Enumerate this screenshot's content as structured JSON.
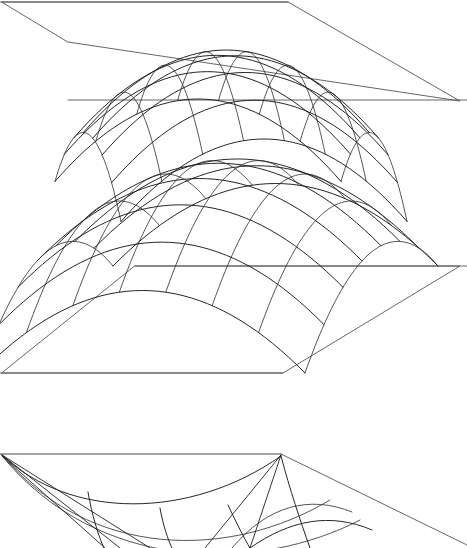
{
  "figure": {
    "background_color": "#ffffff",
    "line_color": "#1a1a1a",
    "plane_color": "#555555",
    "width": 467,
    "height": 548,
    "panel_count": 3
  },
  "panels": [
    {
      "id": "panel-top",
      "name": "elliptic-paraboloid-bowl",
      "caption": "",
      "surface_type": "elliptic paraboloid opening upward",
      "orientation": "bowl",
      "plane": {
        "shape": "parallelogram",
        "back_left": [
          2,
          2
        ],
        "back_right": [
          288,
          2
        ],
        "front_right": [
          460,
          101
        ],
        "front_left": [
          68,
          42
        ],
        "note": "oblique projection of a horizontal cutting plane"
      },
      "curves": {
        "family_a_count": 8,
        "family_b_count": 8,
        "family_a_name": "parabolas along u",
        "family_b_name": "parabolas along v",
        "vertex_depth_px": 170,
        "low_point": [
          205,
          172
        ]
      }
    },
    {
      "id": "panel-middle",
      "name": "elliptic-paraboloid-dome",
      "caption": "",
      "surface_type": "elliptic paraboloid opening downward",
      "orientation": "dome",
      "plane": {
        "shape": "parallelogram",
        "back_left": [
          135,
          266
        ],
        "back_right": [
          460,
          266
        ],
        "front_right": [
          283,
          373
        ],
        "front_left": [
          2,
          373
        ],
        "note": "oblique projection of a horizontal cutting plane"
      },
      "curves": {
        "family_a_count": 8,
        "family_b_count": 8,
        "family_a_name": "parabolas along u",
        "family_b_name": "parabolas along v",
        "apex": [
          237,
          196
        ]
      }
    },
    {
      "id": "panel-bottom",
      "name": "hyperbolic-paraboloid-partial",
      "caption": "",
      "surface_type": "saddle / paraboloid, cropped by image edge",
      "orientation": "cropped",
      "plane": {
        "shape": "parallelogram-partial",
        "back_left": [
          2,
          454
        ],
        "back_right": [
          281,
          454
        ],
        "front_right": [
          460,
          548
        ],
        "front_left": [
          2,
          548
        ],
        "note": "lower figure is cut off by the bottom of the frame"
      },
      "curves": {
        "family_a_count": 5,
        "family_b_count": 4,
        "family_a_name": "meridian arcs",
        "family_b_name": "rulings from corner"
      }
    }
  ],
  "chart_data": {
    "type": "line",
    "xlabel": "",
    "ylabel": "",
    "grid": false,
    "legend": "none",
    "series": [
      {
        "name": "panel-top bowl parabolas u",
        "values": []
      },
      {
        "name": "panel-top bowl parabolas v",
        "values": []
      },
      {
        "name": "panel-middle dome parabolas u",
        "values": []
      },
      {
        "name": "panel-middle dome parabolas v",
        "values": []
      },
      {
        "name": "panel-bottom partial arcs",
        "values": []
      }
    ]
  }
}
